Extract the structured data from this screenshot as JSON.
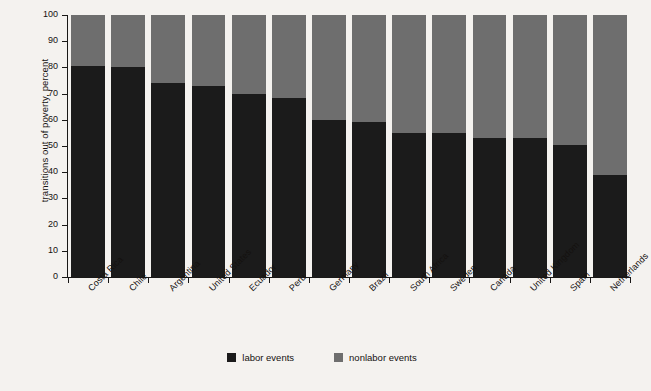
{
  "chart_data": {
    "type": "bar",
    "subtype": "stacked-100-percent",
    "title": "",
    "xlabel": "",
    "ylabel": "transitions out of poverty, percent",
    "ylim": [
      0,
      100
    ],
    "ytick_labels": [
      "100",
      "90",
      "80",
      "70",
      "60",
      "50",
      "40",
      "30",
      "20",
      "10",
      "0"
    ],
    "ytick_values": [
      100,
      90,
      80,
      70,
      60,
      50,
      40,
      30,
      20,
      10,
      0
    ],
    "grid": false,
    "legend_position": "bottom-center",
    "categories": [
      "Costa Rica",
      "Chile",
      "Argentina",
      "United States",
      "Ecuador",
      "Peru",
      "Germany",
      "Brazil",
      "South Africa",
      "Sweden",
      "Canada",
      "United Kingdom",
      "Spain",
      "Netherlands"
    ],
    "series": [
      {
        "name": "labor events",
        "color": "#1b1b1b",
        "values": [
          80.5,
          80.0,
          74.0,
          73.0,
          70.0,
          68.5,
          60.0,
          59.0,
          55.0,
          55.0,
          53.0,
          53.0,
          50.5,
          39.0
        ]
      },
      {
        "name": "nonlabor events",
        "color": "#6e6e6e",
        "values": [
          19.5,
          20.0,
          26.0,
          27.0,
          30.0,
          31.5,
          40.0,
          41.0,
          45.0,
          45.0,
          47.0,
          47.0,
          49.5,
          61.0
        ]
      }
    ]
  },
  "colors": {
    "background": "#f4f2ef",
    "labor": "#1b1b1b",
    "nonlabor": "#6e6e6e",
    "axis": "#191817",
    "text": "#14110f"
  }
}
